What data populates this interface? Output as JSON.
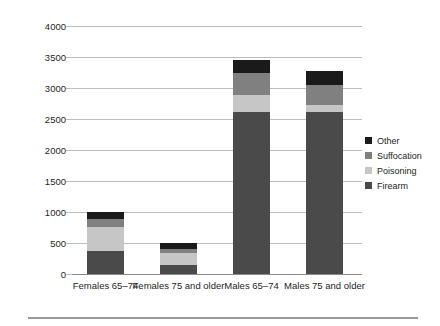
{
  "chart_data": {
    "type": "bar",
    "subtype": "stacked-bar",
    "title": "",
    "xlabel": "",
    "ylabel": "Number of suicides",
    "ylim": [
      0,
      4000
    ],
    "ytick_values": [
      0,
      500,
      1000,
      1500,
      2000,
      2500,
      3000,
      3500,
      4000
    ],
    "ytick_labels": [
      "0",
      "500",
      "1000",
      "1500",
      "2000",
      "2500",
      "3000",
      "3500",
      "4000"
    ],
    "grid": true,
    "legend_position": "right",
    "categories": [
      "Females 65–74",
      "Females 75 and older",
      "Males 65–74",
      "Males 75 and older"
    ],
    "series": [
      {
        "name": "Firearm",
        "color": "#4a4a4a",
        "values": [
          371,
          145,
          2613,
          2613
        ]
      },
      {
        "name": "Poisoning",
        "color": "#c6c6c6",
        "values": [
          387,
          194,
          274,
          113
        ]
      },
      {
        "name": "Suffocation",
        "color": "#808080",
        "values": [
          129,
          64,
          355,
          322
        ]
      },
      {
        "name": "Other",
        "color": "#1a1a1a",
        "values": [
          113,
          97,
          210,
          226
        ]
      }
    ],
    "totals": [
      1000,
      500,
      3452,
      3274
    ],
    "stack_order_bottom_to_top": [
      "Firearm",
      "Poisoning",
      "Suffocation",
      "Other"
    ]
  },
  "axis": {
    "y_title": "Number of suicides"
  },
  "legend": {
    "items": [
      {
        "label": "Other",
        "color": "#1a1a1a"
      },
      {
        "label": "Suffocation",
        "color": "#808080"
      },
      {
        "label": "Poisoning",
        "color": "#c6c6c6"
      },
      {
        "label": "Firearm",
        "color": "#4a4a4a"
      }
    ]
  }
}
